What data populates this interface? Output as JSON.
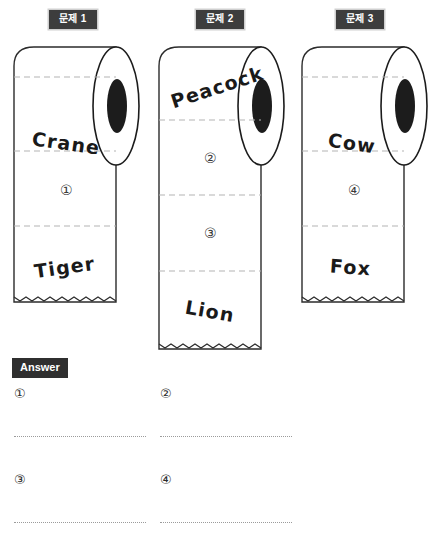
{
  "page": {
    "width": 446,
    "height": 555,
    "background": "#ffffff",
    "ink": "#1a1a1a",
    "badge_bg": "#3d3d3d",
    "badge_text": "#ffffff",
    "badge_border": "#cfcfcf",
    "perforation_color": "#b4b4b4",
    "answer_line_color": "#9b9b9b"
  },
  "problems": [
    {
      "badge": "문제 1",
      "roll_name": "roll-1",
      "sheets": [
        {
          "kind": "word",
          "text": "Crane",
          "rotation": 8
        },
        {
          "kind": "number",
          "text": "①"
        },
        {
          "kind": "word",
          "text": "Tiger",
          "rotation": -8
        }
      ]
    },
    {
      "badge": "문제 2",
      "roll_name": "roll-2",
      "sheets": [
        {
          "kind": "word",
          "text": "Peacock",
          "rotation": -18
        },
        {
          "kind": "number",
          "text": "②"
        },
        {
          "kind": "number",
          "text": "③"
        },
        {
          "kind": "word",
          "text": "Lion",
          "rotation": 10
        }
      ]
    },
    {
      "badge": "문제 3",
      "roll_name": "roll-3",
      "sheets": [
        {
          "kind": "word",
          "text": "Cow",
          "rotation": 8
        },
        {
          "kind": "number",
          "text": "④"
        },
        {
          "kind": "word",
          "text": "Fox",
          "rotation": 4
        }
      ]
    }
  ],
  "answer": {
    "badge": "Answer",
    "slots": [
      {
        "label": "①",
        "value": ""
      },
      {
        "label": "②",
        "value": ""
      },
      {
        "label": "③",
        "value": ""
      },
      {
        "label": "④",
        "value": ""
      }
    ]
  }
}
